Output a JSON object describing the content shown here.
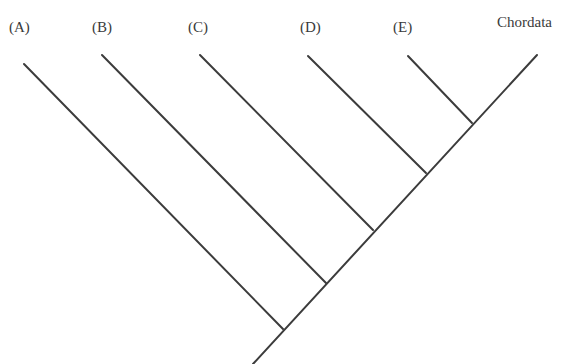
{
  "diagram": {
    "type": "cladogram",
    "taxa": [
      {
        "id": "A",
        "label": "(A)",
        "label_pos": [
          9,
          20
        ],
        "tip": [
          24,
          64
        ],
        "node": [
          283,
          329
        ]
      },
      {
        "id": "B",
        "label": "(B)",
        "label_pos": [
          92,
          20
        ],
        "tip": [
          102,
          55
        ],
        "node": [
          326,
          283
        ]
      },
      {
        "id": "C",
        "label": "(C)",
        "label_pos": [
          188,
          20
        ],
        "tip": [
          200,
          55
        ],
        "node": [
          373,
          230
        ]
      },
      {
        "id": "D",
        "label": "(D)",
        "label_pos": [
          300,
          20
        ],
        "tip": [
          308,
          56
        ],
        "node": [
          426,
          173
        ]
      },
      {
        "id": "E",
        "label": "(E)",
        "label_pos": [
          393,
          20
        ],
        "tip": [
          408,
          56
        ],
        "node": [
          472,
          123
        ]
      },
      {
        "id": "Chordata",
        "label": "Chordata",
        "label_pos": [
          497,
          15
        ],
        "tip": [
          537,
          55
        ],
        "node": [
          472,
          123
        ]
      }
    ],
    "root": [
      253,
      364
    ],
    "line_color": "#3c3c3c"
  }
}
